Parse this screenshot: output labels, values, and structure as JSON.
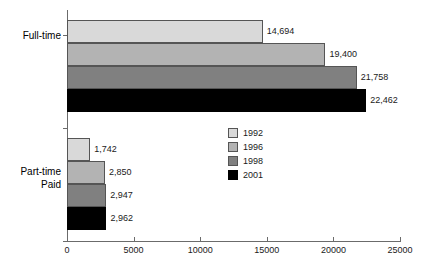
{
  "chart_data": {
    "type": "bar",
    "orientation": "horizontal",
    "title": "",
    "xlabel": "",
    "ylabel": "",
    "categories": [
      "Full-time",
      "Part-time Paid"
    ],
    "category_lines": [
      [
        "Full-time"
      ],
      [
        "Part-time",
        "Paid"
      ]
    ],
    "series": [
      {
        "name": "1992",
        "color": "#d9d9d9",
        "values": [
          14694,
          1742
        ],
        "labels": [
          "14,694",
          "1,742"
        ]
      },
      {
        "name": "1996",
        "color": "#b3b3b3",
        "values": [
          19400,
          2850
        ],
        "labels": [
          "19,400",
          "2,850"
        ]
      },
      {
        "name": "1998",
        "color": "#808080",
        "values": [
          21758,
          2947
        ],
        "labels": [
          "21,758",
          "2,947"
        ]
      },
      {
        "name": "2001",
        "color": "#000000",
        "values": [
          22462,
          2962
        ],
        "labels": [
          "22,462",
          "2,962"
        ]
      }
    ],
    "xlim": [
      0,
      25000
    ],
    "xticks": [
      0,
      5000,
      10000,
      15000,
      20000,
      25000
    ],
    "xticklabels": [
      "0",
      "5000",
      "10000",
      "15000",
      "20000",
      "25000"
    ],
    "grid": false,
    "legend_position": "center",
    "legend_entries": [
      "1992",
      "1996",
      "1998",
      "2001"
    ]
  },
  "axis": {
    "line_color": "#6b6b6b"
  }
}
